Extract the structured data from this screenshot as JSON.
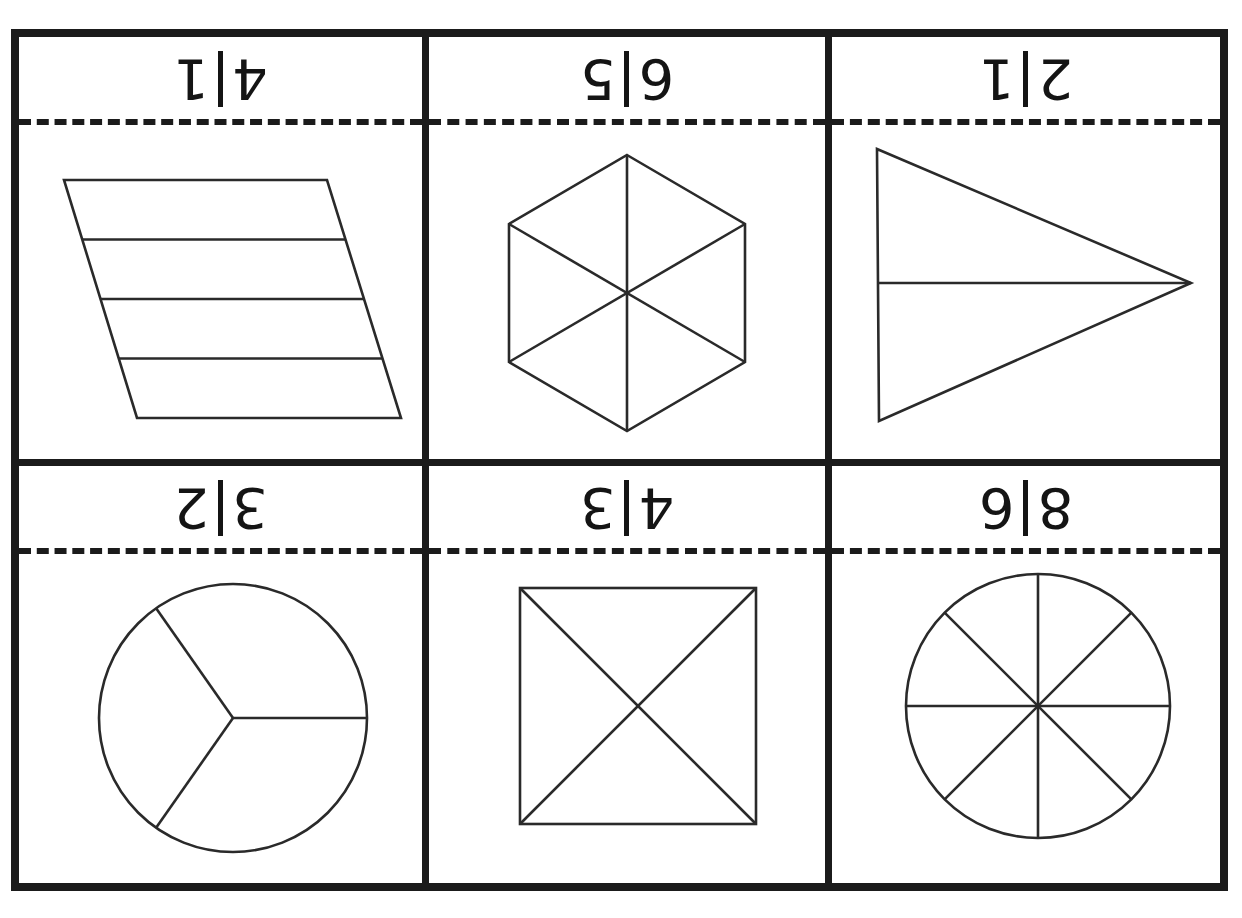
{
  "worksheet": {
    "title": "Fraction shapes worksheet",
    "orientation": "fraction labels printed upside down",
    "rows": 2,
    "columns": 3,
    "ink_color": "#1b1b1b",
    "line_color": "#2a2a2a",
    "background_color": "#ffffff",
    "cut_line_style": "dashed"
  },
  "cells": [
    {
      "id": "cell-1",
      "fraction": "1/4",
      "numerator": "1",
      "denominator": "4",
      "shape": "parallelogram",
      "parts": 4,
      "division": "four horizontal strips"
    },
    {
      "id": "cell-2",
      "fraction": "5/6",
      "numerator": "5",
      "denominator": "6",
      "shape": "hexagon",
      "parts": 6,
      "division": "six triangles from center"
    },
    {
      "id": "cell-3",
      "fraction": "1/2",
      "numerator": "1",
      "denominator": "2",
      "shape": "triangle",
      "parts": 2,
      "division": "one horizontal median line"
    },
    {
      "id": "cell-4",
      "fraction": "2/3",
      "numerator": "2",
      "denominator": "3",
      "shape": "circle",
      "parts": 3,
      "division": "three equal sectors"
    },
    {
      "id": "cell-5",
      "fraction": "3/4",
      "numerator": "3",
      "denominator": "4",
      "shape": "square",
      "parts": 4,
      "division": "both diagonals"
    },
    {
      "id": "cell-6",
      "fraction": "6/8",
      "numerator": "6",
      "denominator": "8",
      "shape": "circle",
      "parts": 8,
      "division": "eight equal sectors"
    }
  ]
}
